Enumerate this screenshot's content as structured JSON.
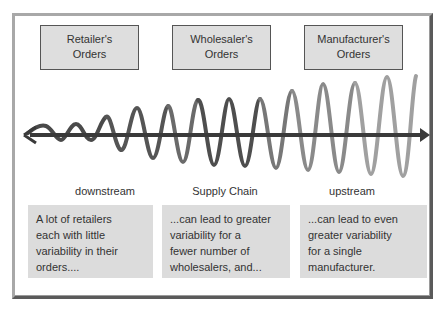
{
  "headers": [
    {
      "line1": "Retailer's",
      "line2": "Orders"
    },
    {
      "line1": "Wholesaler's",
      "line2": "Orders"
    },
    {
      "line1": "Manufacturer's",
      "line2": "Orders"
    }
  ],
  "axis_labels": {
    "left": "downstream",
    "center": "Supply Chain",
    "right": "upstream"
  },
  "descriptions": [
    {
      "lines": [
        "A lot of retailers",
        "each with little",
        "variability in their",
        "orders...."
      ]
    },
    {
      "lines": [
        "...can lead to greater",
        "variability for a",
        "fewer number of",
        "wholesalers, and..."
      ]
    },
    {
      "lines": [
        "...can lead to even",
        "greater variability",
        "for a single",
        "manufacturer."
      ]
    }
  ],
  "colors": {
    "dark_wave": "#4a4a4a",
    "mid_wave": "#7a7a7a",
    "light_wave": "#a8a8a8",
    "axis": "#3a3a3a",
    "box_fill": "#dcdcdc",
    "header_fill": "#dedede"
  }
}
